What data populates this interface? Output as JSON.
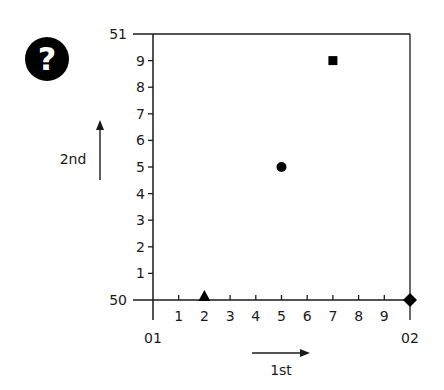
{
  "badge": {
    "icon": "question-mark-icon",
    "glyph": "?"
  },
  "chart_data": {
    "type": "scatter",
    "title": "",
    "xlabel": "1st",
    "ylabel": "2nd",
    "xlim": [
      0,
      10
    ],
    "ylim": [
      0,
      10
    ],
    "grid": false,
    "legend": null,
    "x_ticks": [
      {
        "value": 0,
        "label": "01"
      },
      {
        "value": 1,
        "label": "1"
      },
      {
        "value": 2,
        "label": "2"
      },
      {
        "value": 3,
        "label": "3"
      },
      {
        "value": 4,
        "label": "4"
      },
      {
        "value": 5,
        "label": "5"
      },
      {
        "value": 6,
        "label": "6"
      },
      {
        "value": 7,
        "label": "7"
      },
      {
        "value": 8,
        "label": "8"
      },
      {
        "value": 9,
        "label": "9"
      },
      {
        "value": 10,
        "label": "02"
      }
    ],
    "y_ticks": [
      {
        "value": 0,
        "label": "50"
      },
      {
        "value": 1,
        "label": "1"
      },
      {
        "value": 2,
        "label": "2"
      },
      {
        "value": 3,
        "label": "3"
      },
      {
        "value": 4,
        "label": "4"
      },
      {
        "value": 5,
        "label": "5"
      },
      {
        "value": 6,
        "label": "6"
      },
      {
        "value": 7,
        "label": "7"
      },
      {
        "value": 8,
        "label": "8"
      },
      {
        "value": 9,
        "label": "9"
      },
      {
        "value": 10,
        "label": "51"
      }
    ],
    "points": [
      {
        "marker": "triangle",
        "x": 2,
        "y": 0
      },
      {
        "marker": "circle",
        "x": 5,
        "y": 5
      },
      {
        "marker": "square",
        "x": 7,
        "y": 9
      },
      {
        "marker": "diamond",
        "x": 10,
        "y": 0
      }
    ],
    "colors": {
      "axis": "#1a1a1a",
      "marker": "#000000",
      "background": "#ffffff"
    }
  }
}
